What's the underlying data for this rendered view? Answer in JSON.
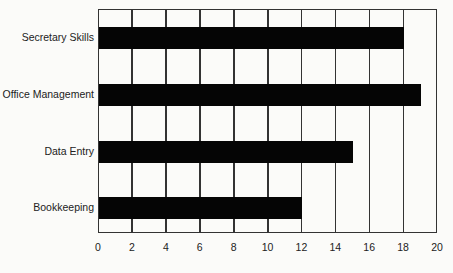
{
  "chart_data": {
    "type": "bar",
    "orientation": "horizontal",
    "title": "",
    "xlabel": "",
    "ylabel": "",
    "categories": [
      "Secretary Skills",
      "Office Management",
      "Data Entry",
      "Bookkeeping"
    ],
    "values": [
      18,
      19,
      15,
      12
    ],
    "xlim": [
      0,
      20
    ],
    "x_ticks": [
      "0",
      "2",
      "4",
      "6",
      "8",
      "10",
      "12",
      "14",
      "16",
      "18",
      "20"
    ],
    "grid": "vertical lines",
    "legend": "none",
    "bar_color": "#050505"
  }
}
